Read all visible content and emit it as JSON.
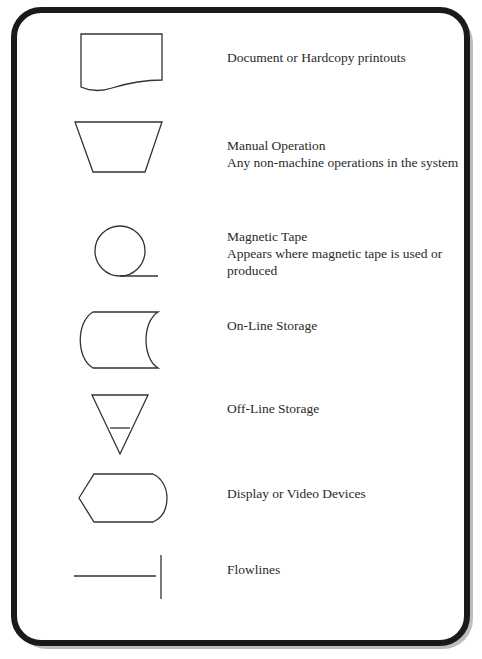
{
  "colors": {
    "frame_border": "#1a1a1a",
    "frame_shadow": "#bdbdbd",
    "stroke": "#333333",
    "text": "#2a2a2a",
    "background": "#ffffff"
  },
  "symbols": [
    {
      "shape": "document-icon",
      "lines": [
        "Document or Hardcopy printouts"
      ]
    },
    {
      "shape": "manual-operation-icon",
      "lines": [
        "Manual Operation",
        "Any non-machine operations in the system"
      ]
    },
    {
      "shape": "magnetic-tape-icon",
      "lines": [
        "Magnetic Tape",
        "Appears where magnetic tape is used or",
        "produced"
      ]
    },
    {
      "shape": "online-storage-icon",
      "lines": [
        "On-Line Storage"
      ]
    },
    {
      "shape": "offline-storage-icon",
      "lines": [
        "Off-Line Storage"
      ]
    },
    {
      "shape": "display-icon",
      "lines": [
        "Display or Video Devices"
      ]
    },
    {
      "shape": "flowlines-icon",
      "lines": [
        "Flowlines"
      ]
    }
  ]
}
